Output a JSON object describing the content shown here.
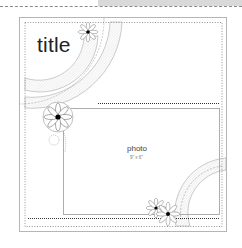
{
  "sketch": {
    "title_label": "title",
    "photo_label": "photo",
    "photo_size": "9\" x 6\""
  },
  "colors": {
    "line": "#9a9a9a",
    "dotted": "#555555",
    "hatch": "#bdbdbd",
    "flower_center": "#000000",
    "band": "#d9d9d9"
  }
}
